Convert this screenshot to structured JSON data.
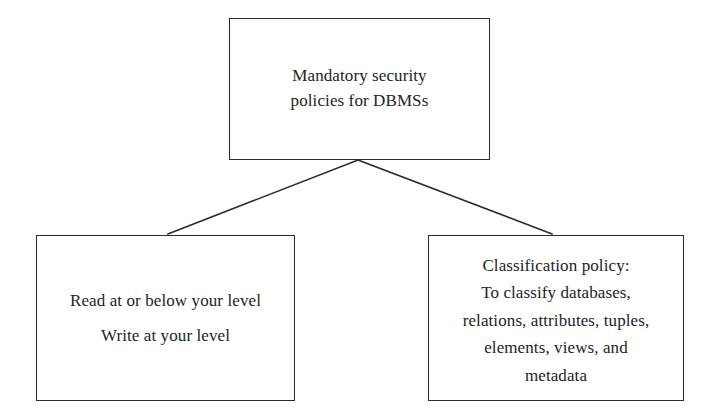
{
  "figure": {
    "type": "hierarchy-diagram",
    "background_color": "#ffffff",
    "line_color": "#2b2b2b",
    "text_color": "#232323"
  },
  "nodes": {
    "root": {
      "name": "mandatory-security-policies",
      "lines": [
        "Mandatory security",
        "policies for DBMSs"
      ]
    },
    "left": {
      "name": "access-rules",
      "lines": [
        "Read at or below your level",
        "Write at your level"
      ]
    },
    "right": {
      "name": "classification-policy",
      "heading": "Classification policy:",
      "lines": [
        "To classify databases,",
        "relations, attributes, tuples,",
        "elements, views, and",
        "metadata"
      ]
    }
  },
  "connectors": [
    {
      "name": "connector-root-to-left",
      "from": "root",
      "to": "left",
      "x1": 358,
      "y1": 160,
      "x2": 168,
      "y2": 234
    },
    {
      "name": "connector-root-to-right",
      "from": "root",
      "to": "right",
      "x1": 358,
      "y1": 160,
      "x2": 552,
      "y2": 234
    }
  ]
}
